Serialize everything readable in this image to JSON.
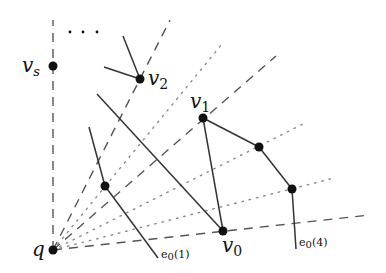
{
  "diagram": {
    "type": "geometric-graph",
    "colors": {
      "ink": "#111111",
      "guide": "#555555",
      "dotted": "#888888",
      "background": "#ffffff"
    },
    "labels": {
      "q": "q",
      "vs": "v",
      "vs_sub": "s",
      "v0": "v",
      "v0_sub": "0",
      "v1": "v",
      "v1_sub": "1",
      "v2": "v",
      "v2_sub": "2",
      "e01": "e",
      "e01_sub": "0",
      "e01_arg": "(1)",
      "e04": "e",
      "e04_sub": "0",
      "e04_arg": "(4)",
      "ellipsis": "· · ·"
    },
    "nodes": [
      {
        "id": "q",
        "x": 53,
        "y": 250
      },
      {
        "id": "v_s",
        "x": 53,
        "y": 66
      },
      {
        "id": "v_2",
        "x": 140,
        "y": 79
      },
      {
        "id": "v_1",
        "x": 203,
        "y": 118
      },
      {
        "id": "a",
        "x": 259,
        "y": 147
      },
      {
        "id": "b",
        "x": 292,
        "y": 189
      },
      {
        "id": "v_0",
        "x": 223,
        "y": 231
      },
      {
        "id": "c",
        "x": 105,
        "y": 186
      }
    ]
  }
}
